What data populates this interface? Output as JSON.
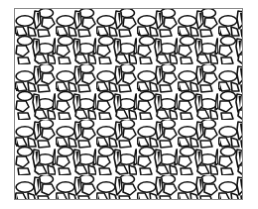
{
  "image": {
    "kind": "decorative-mosaic-pattern",
    "description": "Black-and-white mosaic of flower-like motifs: horizontal ellipse petals, elongated vertical cells, and small black wedges, tiled in offset rows inside a thin gray frame",
    "colors": {
      "background": "#ffffff",
      "cell_fill": "#ffffff",
      "outline": "#111111",
      "wedge": "#111111",
      "frame_border": "#8a8a8a"
    },
    "frame": {
      "x": 14,
      "y": 8,
      "width": 229,
      "height": 192
    },
    "tile": {
      "width": 41,
      "height": 56,
      "row_offset_x": 20.5
    }
  }
}
